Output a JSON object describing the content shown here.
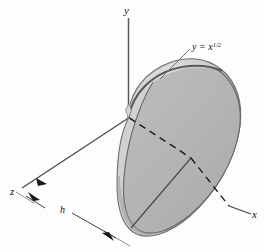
{
  "figure": {
    "kind": "3d-solid-of-revolution-diagram",
    "background_color": "#fdfdfd",
    "axes": {
      "y_label": "y",
      "x_label": "x",
      "z_label": "z"
    },
    "curve_label": {
      "base": "y = x",
      "exponent": "1/2",
      "full": "y = x^(1/2)"
    },
    "dimension": {
      "label": "h"
    },
    "colors": {
      "solid_front_face": "#b4b4b4",
      "solid_side_surface": "#c9c9c9",
      "solid_highlight_band": "#d8d8d8",
      "solid_shadow": "#a2a2a2",
      "outline": "#6b6b6b",
      "axis_line": "#555555",
      "hidden_axis_dash": "#2a2a2a",
      "text": "#141414"
    }
  }
}
